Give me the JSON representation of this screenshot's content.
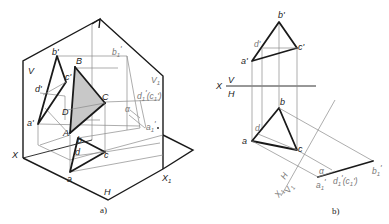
{
  "figure_a": {
    "caption": "a)",
    "planes": {
      "V": "V",
      "H": "H",
      "V1": "V",
      "V1_sub": "1"
    },
    "axes": {
      "X": "X",
      "X1": "X",
      "X1_sub": "1"
    },
    "points_3d": {
      "A": "A",
      "B": "B",
      "C": "C",
      "D": "D"
    },
    "projections_v": {
      "a": "a'",
      "b": "b'",
      "c": "c'",
      "d": "d'"
    },
    "projections_h": {
      "a": "a",
      "b": "b",
      "c": "c",
      "d": "d"
    },
    "projections_v1": {
      "a": "a",
      "a_sub": "1",
      "a_prime": "'",
      "b": "b",
      "b_sub": "1",
      "b_prime": "'",
      "dc": "d",
      "dc_sub": "1",
      "dc_prime": "'",
      "dc_paren": "(c",
      "dc_paren_sub": "1",
      "dc_paren_end": "')"
    },
    "angle": "α"
  },
  "figure_b": {
    "caption": "b)",
    "axis_vh": {
      "X": "X",
      "V": "V",
      "H": "H"
    },
    "axis_hv1": {
      "X1": "X",
      "X1_sub": "1",
      "H": "H",
      "V1": "V",
      "V1_sub": "1"
    },
    "projections_v": {
      "a": "a'",
      "b": "b'",
      "c": "c'",
      "d": "d'"
    },
    "projections_h": {
      "a": "a",
      "b": "b",
      "c": "c",
      "d": "d"
    },
    "projections_v1": {
      "a": "a",
      "a_sub": "1",
      "a_prime": "'",
      "b": "b",
      "b_sub": "1",
      "b_prime": "'",
      "dc": "d",
      "dc_sub": "1",
      "dc_prime": "'",
      "dc_paren": "(c",
      "dc_paren_sub": "1",
      "dc_paren_end": "')"
    },
    "angle": "α"
  }
}
